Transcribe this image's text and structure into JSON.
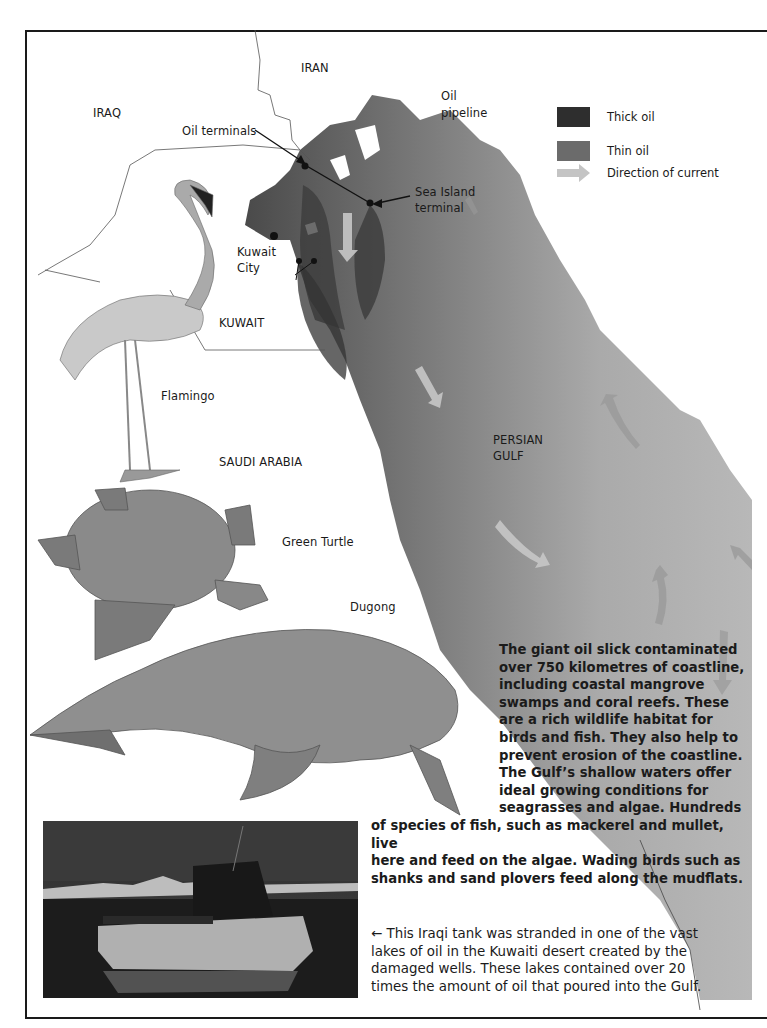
{
  "map": {
    "countries": {
      "iran": "IRAN",
      "iraq": "IRAQ",
      "kuwait": "KUWAIT",
      "saudi_arabia": "SAUDI ARABIA"
    },
    "places": {
      "kuwait_city_line1": "Kuwait",
      "kuwait_city_line2": "City",
      "persian_gulf_line1": "PERSIAN",
      "persian_gulf_line2": "GULF"
    },
    "annotations": {
      "oil_terminals": "Oil terminals",
      "oil_pipeline_line1": "Oil",
      "oil_pipeline_line2": "pipeline",
      "sea_island_line1": "Sea Island",
      "sea_island_line2": "terminal"
    },
    "colors": {
      "thick_oil": "#2e2e2e",
      "thin_oil": "#6b6b6b",
      "current_arrow": "#c4c4c4",
      "sea_light": "#b8b8b8",
      "sea_dark": "#5a5a5a",
      "border": "#1a1a1a"
    }
  },
  "legend": {
    "items": [
      {
        "label": "Thick oil",
        "icon": "thick-oil-swatch"
      },
      {
        "label": "Thin oil",
        "icon": "thin-oil-swatch"
      },
      {
        "label": "Direction of current",
        "icon": "current-arrow-icon"
      }
    ]
  },
  "animals": {
    "flamingo": "Flamingo",
    "turtle": "Green Turtle",
    "dugong": "Dugong"
  },
  "text": {
    "paragraph1_narrow": [
      "The giant oil slick contaminated",
      "over 750 kilometres of coastline,",
      "including coastal mangrove",
      "swamps and coral reefs. These",
      "are a rich wildlife habitat for",
      "birds and fish. They also help to",
      "prevent erosion of the coastline.",
      "The Gulf’s shallow waters offer",
      "ideal growing conditions for",
      "seagrasses and algae. Hundreds"
    ],
    "paragraph1_wide": [
      "of species of fish, such as mackerel and mullet, live",
      "here and feed on the algae. Wading birds such as",
      "shanks and sand plovers feed along the mudflats."
    ],
    "caption": [
      "← This Iraqi tank was stranded in one of the vast",
      "lakes of oil in the Kuwaiti desert created by the",
      "damaged wells. These lakes contained over 20",
      "times the amount of oil that poured into the Gulf."
    ]
  },
  "photo": {
    "subject": "Iraqi tank stranded in lake of oil"
  }
}
